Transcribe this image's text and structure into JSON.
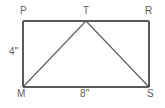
{
  "figure": {
    "kind": "geometry-diagram",
    "background_color": "#ffffff",
    "stroke_color": "#5a5a5a",
    "text_color": "#5d5d5d",
    "vertices": [
      {
        "id": "P",
        "label": "P",
        "role": "rectangle-top-left-corner",
        "x": 23,
        "y": 21
      },
      {
        "id": "T",
        "label": "T",
        "role": "triangle-apex-on-top-side",
        "x": 86,
        "y": 21
      },
      {
        "id": "R",
        "label": "R",
        "role": "rectangle-top-right-corner",
        "x": 149,
        "y": 21
      },
      {
        "id": "M",
        "label": "M",
        "role": "rectangle-bottom-left-corner",
        "x": 23,
        "y": 87
      },
      {
        "id": "S",
        "label": "S",
        "role": "rectangle-bottom-right-corner",
        "x": 149,
        "y": 87
      }
    ],
    "edges": [
      {
        "id": "PR",
        "from": "P",
        "to": "R",
        "role": "rectangle-top-side"
      },
      {
        "id": "RS",
        "from": "R",
        "to": "S",
        "role": "rectangle-right-side"
      },
      {
        "id": "SM",
        "from": "S",
        "to": "M",
        "role": "rectangle-bottom-side"
      },
      {
        "id": "MP",
        "from": "M",
        "to": "P",
        "role": "rectangle-left-side"
      },
      {
        "id": "MT",
        "from": "M",
        "to": "T",
        "role": "triangle-left-leg"
      },
      {
        "id": "TS",
        "from": "T",
        "to": "S",
        "role": "triangle-right-leg"
      }
    ],
    "measurements": [
      {
        "id": "height",
        "label": "4\"",
        "value": 4,
        "unit": "inches",
        "applies_to": "MP"
      },
      {
        "id": "base",
        "label": "8\"",
        "value": 8,
        "unit": "inches",
        "applies_to": "MS"
      }
    ]
  }
}
